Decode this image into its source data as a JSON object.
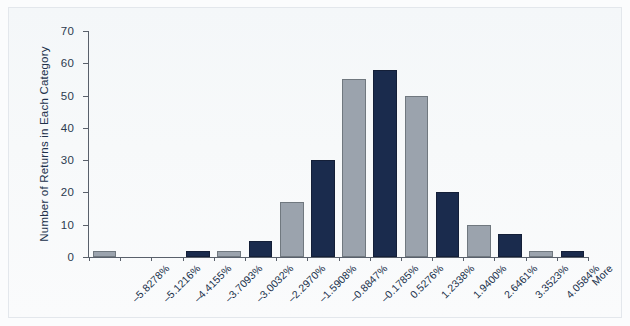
{
  "chart_data": {
    "type": "bar",
    "title": "",
    "subtitle": "",
    "xlabel": "",
    "ylabel": "Number of Returns in Each Category",
    "ylim": [
      0,
      70
    ],
    "yticks": [
      0,
      10,
      20,
      30,
      40,
      50,
      60,
      70
    ],
    "ytick_labels": [
      "0",
      "10",
      "20",
      "30",
      "40",
      "50",
      "60",
      "70"
    ],
    "grid": false,
    "legend": "none",
    "bar_colors": [
      "#9ba3ad",
      "#1a2b4d"
    ],
    "categories": [
      "–5.8278%",
      "–5.1216%",
      "–4.4155%",
      "–3.7093%",
      "–3.0032%",
      "–2.2970%",
      "–1.5908%",
      "–0.8847%",
      "–0.1785%",
      "0.5276%",
      "1.2338%",
      "1.9400%",
      "2.6461%",
      "3.3523%",
      "4.0584%",
      "More"
    ],
    "values": [
      2,
      0,
      0,
      2,
      2,
      5,
      17,
      30,
      55,
      58,
      50,
      20,
      10,
      7,
      2,
      2
    ],
    "colors": [
      "gray",
      "gray",
      "navy",
      "navy",
      "gray",
      "navy",
      "gray",
      "navy",
      "gray",
      "navy",
      "gray",
      "navy",
      "gray",
      "navy",
      "gray",
      "navy"
    ]
  },
  "axis": {
    "y_title": "Number of Returns in Each Category"
  }
}
